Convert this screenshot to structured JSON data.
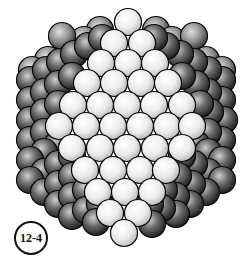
{
  "figure": {
    "label": "12-4",
    "sphere_radius": 13.5,
    "colors": {
      "front_light": "#f4f4f4",
      "front_mid": "#cfcfcf",
      "side_dark": "#2a2a2a",
      "side_mid": "#7a7a7a",
      "outline": "#0a0a0a"
    },
    "back_spheres": [
      [
        100,
        30
      ],
      [
        156,
        30
      ],
      [
        84,
        40
      ],
      [
        172,
        40
      ],
      [
        66,
        50
      ],
      [
        190,
        50
      ],
      [
        48,
        60
      ],
      [
        206,
        60
      ],
      [
        32,
        70
      ],
      [
        222,
        70
      ],
      [
        62,
        36
      ],
      [
        194,
        36
      ]
    ],
    "left_side_spheres": [
      [
        30,
        80
      ],
      [
        46,
        70
      ],
      [
        60,
        62
      ],
      [
        74,
        54
      ],
      [
        88,
        46
      ],
      [
        102,
        38
      ],
      [
        30,
        100
      ],
      [
        44,
        92
      ],
      [
        58,
        84
      ],
      [
        72,
        76
      ],
      [
        30,
        120
      ],
      [
        44,
        112
      ],
      [
        58,
        104
      ],
      [
        30,
        140
      ],
      [
        44,
        132
      ],
      [
        58,
        144
      ],
      [
        44,
        152
      ],
      [
        30,
        160
      ],
      [
        44,
        172
      ],
      [
        58,
        164
      ],
      [
        72,
        156
      ],
      [
        30,
        180
      ],
      [
        44,
        192
      ],
      [
        58,
        184
      ],
      [
        72,
        176
      ],
      [
        58,
        204
      ],
      [
        72,
        196
      ],
      [
        86,
        190
      ],
      [
        72,
        216
      ],
      [
        86,
        210
      ],
      [
        100,
        204
      ],
      [
        96,
        222
      ]
    ],
    "right_side_spheres": [
      [
        222,
        80
      ],
      [
        208,
        70
      ],
      [
        194,
        62
      ],
      [
        180,
        54
      ],
      [
        166,
        46
      ],
      [
        154,
        38
      ],
      [
        222,
        100
      ],
      [
        208,
        92
      ],
      [
        196,
        84
      ],
      [
        182,
        76
      ],
      [
        224,
        120
      ],
      [
        210,
        112
      ],
      [
        200,
        104
      ],
      [
        222,
        140
      ],
      [
        208,
        132
      ],
      [
        196,
        144
      ],
      [
        208,
        152
      ],
      [
        222,
        160
      ],
      [
        208,
        172
      ],
      [
        194,
        164
      ],
      [
        182,
        156
      ],
      [
        222,
        180
      ],
      [
        206,
        192
      ],
      [
        192,
        184
      ],
      [
        178,
        176
      ],
      [
        190,
        204
      ],
      [
        176,
        196
      ],
      [
        164,
        190
      ],
      [
        176,
        214
      ],
      [
        162,
        208
      ],
      [
        150,
        204
      ],
      [
        152,
        224
      ]
    ],
    "front_spheres": [
      [
        128,
        22
      ],
      [
        114,
        43
      ],
      [
        142,
        43
      ],
      [
        101,
        63
      ],
      [
        128,
        63
      ],
      [
        155,
        63
      ],
      [
        87,
        83
      ],
      [
        114,
        83
      ],
      [
        141,
        83
      ],
      [
        168,
        83
      ],
      [
        73,
        105
      ],
      [
        100,
        105
      ],
      [
        127,
        105
      ],
      [
        154,
        105
      ],
      [
        182,
        105
      ],
      [
        59,
        126
      ],
      [
        86,
        126
      ],
      [
        113,
        126
      ],
      [
        140,
        126
      ],
      [
        167,
        126
      ],
      [
        192,
        126
      ],
      [
        72,
        148
      ],
      [
        100,
        148
      ],
      [
        127,
        148
      ],
      [
        155,
        148
      ],
      [
        182,
        148
      ],
      [
        85,
        170
      ],
      [
        113,
        170
      ],
      [
        140,
        170
      ],
      [
        166,
        170
      ],
      [
        98,
        192
      ],
      [
        125,
        192
      ],
      [
        152,
        192
      ],
      [
        110,
        213
      ],
      [
        138,
        213
      ],
      [
        124,
        233
      ]
    ]
  }
}
